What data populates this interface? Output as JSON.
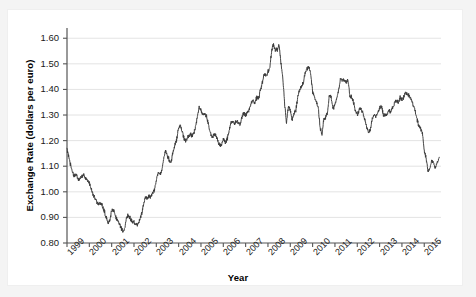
{
  "figure": {
    "background_color": "#ffffff",
    "frame_color": "#f2f2f2",
    "line_color": "#3a3a3a",
    "grid_color": "#dcdcdc",
    "axis_color": "#555555"
  },
  "chart_data": {
    "type": "line",
    "title": "",
    "subtitle": "",
    "xlabel": "Year",
    "ylabel": "Exchange Rate (dollars per euro)",
    "xlim": [
      1999,
      2015.75
    ],
    "ylim": [
      0.8,
      1.64
    ],
    "grid": true,
    "grid_axis": "y",
    "legend": false,
    "legend_position": "none",
    "xticks": [
      1999,
      2000,
      2001,
      2002,
      2003,
      2004,
      2005,
      2006,
      2007,
      2008,
      2009,
      2010,
      2011,
      2012,
      2013,
      2014,
      2015
    ],
    "xtick_labels": [
      "1999",
      "2000",
      "2001",
      "2002",
      "2003",
      "2004",
      "2005",
      "2006",
      "2007",
      "2008",
      "2009",
      "2010",
      "2011",
      "2012",
      "2013",
      "2014",
      "2015"
    ],
    "yticks": [
      0.8,
      0.9,
      1.0,
      1.1,
      1.2,
      1.3,
      1.4,
      1.5,
      1.6
    ],
    "ytick_labels": [
      "0.80",
      "0.90",
      "1.00",
      "1.10",
      "1.20",
      "1.30",
      "1.40",
      "1.50",
      "1.60"
    ],
    "series": [
      {
        "name": "USD per EUR",
        "x": [
          1999.0,
          1999.08,
          1999.17,
          1999.25,
          1999.33,
          1999.42,
          1999.5,
          1999.58,
          1999.67,
          1999.75,
          1999.83,
          1999.92,
          2000.0,
          2000.08,
          2000.17,
          2000.25,
          2000.33,
          2000.42,
          2000.5,
          2000.58,
          2000.67,
          2000.75,
          2000.83,
          2000.92,
          2001.0,
          2001.08,
          2001.17,
          2001.25,
          2001.33,
          2001.42,
          2001.5,
          2001.58,
          2001.67,
          2001.75,
          2001.83,
          2001.92,
          2002.0,
          2002.08,
          2002.17,
          2002.25,
          2002.33,
          2002.42,
          2002.5,
          2002.58,
          2002.67,
          2002.75,
          2002.83,
          2002.92,
          2003.0,
          2003.08,
          2003.17,
          2003.25,
          2003.33,
          2003.42,
          2003.5,
          2003.58,
          2003.67,
          2003.75,
          2003.83,
          2003.92,
          2004.0,
          2004.08,
          2004.17,
          2004.25,
          2004.33,
          2004.42,
          2004.5,
          2004.58,
          2004.67,
          2004.75,
          2004.83,
          2004.92,
          2005.0,
          2005.08,
          2005.17,
          2005.25,
          2005.33,
          2005.42,
          2005.5,
          2005.58,
          2005.67,
          2005.75,
          2005.83,
          2005.92,
          2006.0,
          2006.08,
          2006.17,
          2006.25,
          2006.33,
          2006.42,
          2006.5,
          2006.58,
          2006.67,
          2006.75,
          2006.83,
          2006.92,
          2007.0,
          2007.08,
          2007.17,
          2007.25,
          2007.33,
          2007.42,
          2007.5,
          2007.58,
          2007.67,
          2007.75,
          2007.83,
          2007.92,
          2008.0,
          2008.08,
          2008.17,
          2008.25,
          2008.33,
          2008.42,
          2008.5,
          2008.58,
          2008.67,
          2008.75,
          2008.83,
          2008.92,
          2009.0,
          2009.08,
          2009.17,
          2009.25,
          2009.33,
          2009.42,
          2009.5,
          2009.58,
          2009.67,
          2009.75,
          2009.83,
          2009.92,
          2010.0,
          2010.08,
          2010.17,
          2010.25,
          2010.33,
          2010.42,
          2010.5,
          2010.58,
          2010.67,
          2010.75,
          2010.83,
          2010.92,
          2011.0,
          2011.08,
          2011.17,
          2011.25,
          2011.33,
          2011.42,
          2011.5,
          2011.58,
          2011.67,
          2011.75,
          2011.83,
          2011.92,
          2012.0,
          2012.08,
          2012.17,
          2012.25,
          2012.33,
          2012.42,
          2012.5,
          2012.58,
          2012.67,
          2012.75,
          2012.83,
          2012.92,
          2013.0,
          2013.08,
          2013.17,
          2013.25,
          2013.33,
          2013.42,
          2013.5,
          2013.58,
          2013.67,
          2013.75,
          2013.83,
          2013.92,
          2014.0,
          2014.08,
          2014.17,
          2014.25,
          2014.33,
          2014.42,
          2014.5,
          2014.58,
          2014.67,
          2014.75,
          2014.83,
          2014.92,
          2015.0,
          2015.08,
          2015.17,
          2015.25,
          2015.33,
          2015.42,
          2015.5,
          2015.58,
          2015.67
        ],
        "y": [
          1.165,
          1.14,
          1.1,
          1.075,
          1.062,
          1.07,
          1.045,
          1.055,
          1.06,
          1.07,
          1.055,
          1.045,
          1.035,
          1.01,
          0.99,
          0.975,
          0.96,
          0.95,
          0.955,
          0.945,
          0.925,
          0.9,
          0.88,
          0.89,
          0.925,
          0.93,
          0.905,
          0.89,
          0.875,
          0.86,
          0.845,
          0.855,
          0.9,
          0.91,
          0.895,
          0.885,
          0.88,
          0.87,
          0.875,
          0.885,
          0.91,
          0.945,
          0.98,
          0.975,
          0.985,
          0.98,
          0.995,
          1.01,
          1.045,
          1.075,
          1.065,
          1.085,
          1.13,
          1.16,
          1.14,
          1.125,
          1.115,
          1.16,
          1.18,
          1.21,
          1.25,
          1.26,
          1.23,
          1.205,
          1.2,
          1.215,
          1.225,
          1.22,
          1.225,
          1.25,
          1.29,
          1.33,
          1.32,
          1.3,
          1.305,
          1.295,
          1.265,
          1.23,
          1.21,
          1.225,
          1.22,
          1.2,
          1.18,
          1.185,
          1.205,
          1.195,
          1.205,
          1.23,
          1.27,
          1.275,
          1.265,
          1.275,
          1.27,
          1.26,
          1.29,
          1.31,
          1.3,
          1.31,
          1.325,
          1.345,
          1.355,
          1.345,
          1.37,
          1.365,
          1.4,
          1.425,
          1.46,
          1.455,
          1.47,
          1.48,
          1.555,
          1.575,
          1.555,
          1.555,
          1.575,
          1.505,
          1.44,
          1.34,
          1.27,
          1.34,
          1.32,
          1.28,
          1.305,
          1.32,
          1.365,
          1.4,
          1.41,
          1.425,
          1.465,
          1.48,
          1.49,
          1.46,
          1.39,
          1.37,
          1.35,
          1.33,
          1.255,
          1.22,
          1.285,
          1.29,
          1.31,
          1.38,
          1.37,
          1.325,
          1.34,
          1.365,
          1.4,
          1.445,
          1.435,
          1.44,
          1.43,
          1.435,
          1.375,
          1.37,
          1.35,
          1.315,
          1.3,
          1.32,
          1.32,
          1.31,
          1.28,
          1.255,
          1.23,
          1.24,
          1.285,
          1.3,
          1.295,
          1.31,
          1.33,
          1.335,
          1.3,
          1.3,
          1.3,
          1.32,
          1.31,
          1.33,
          1.345,
          1.36,
          1.35,
          1.37,
          1.36,
          1.37,
          1.385,
          1.38,
          1.375,
          1.36,
          1.34,
          1.32,
          1.285,
          1.26,
          1.25,
          1.23,
          1.16,
          1.135,
          1.08,
          1.09,
          1.12,
          1.115,
          1.095,
          1.115,
          1.135
        ]
      }
    ],
    "annotations": []
  }
}
